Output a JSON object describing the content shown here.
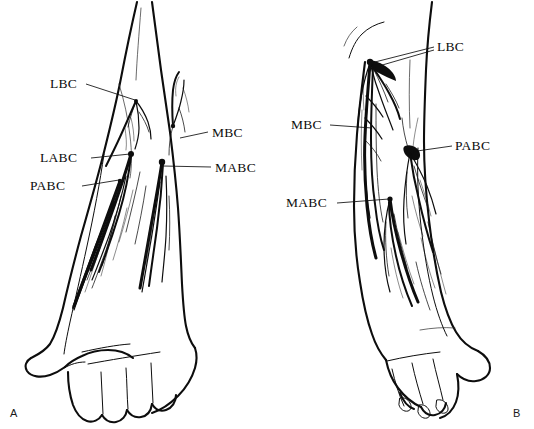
{
  "figure": {
    "background_color": "#ffffff",
    "ink_color": "#0d0d0d",
    "width": 534,
    "height": 429
  },
  "panels": [
    {
      "id": "A",
      "letter": "A",
      "letter_x": 10,
      "letter_y": 417,
      "view": "anterior",
      "labels": [
        {
          "id": "a-lbc",
          "text": "LBC",
          "name": "lateral-brachial-cutaneous",
          "text_x": 50,
          "text_y": 88,
          "leader": "M86,84 L135,100"
        },
        {
          "id": "a-labc",
          "text": "LABC",
          "name": "lateral-antebrachial-cutaneous",
          "text_x": 40,
          "text_y": 162,
          "leader": "M91,158 L130,154"
        },
        {
          "id": "a-pabc",
          "text": "PABC",
          "name": "posterior-antebrachial-cutaneous",
          "text_x": 30,
          "text_y": 190,
          "leader": "M82,186 L119,180"
        },
        {
          "id": "a-mbc",
          "text": "MBC",
          "name": "medial-brachial-cutaneous",
          "text_x": 212,
          "text_y": 137,
          "leader": "M208,132 L180,138"
        },
        {
          "id": "a-mabc",
          "text": "MABC",
          "name": "medial-antebrachial-cutaneous",
          "text_x": 215,
          "text_y": 172,
          "leader": "M211,167 L163,166"
        }
      ]
    },
    {
      "id": "B",
      "letter": "B",
      "letter_x": 513,
      "letter_y": 417,
      "view": "posterior",
      "labels": [
        {
          "id": "b-lbc",
          "text": "LBC",
          "name": "lateral-brachial-cutaneous",
          "text_x": 437,
          "text_y": 51,
          "leader": "M434,47 L371,63"
        },
        {
          "id": "b-mbc",
          "text": "MBC",
          "name": "medial-brachial-cutaneous",
          "text_x": 291,
          "text_y": 129,
          "leader": "M330,125 L372,128"
        },
        {
          "id": "b-pabc",
          "text": "PABC",
          "name": "posterior-antebrachial-cutaneous",
          "text_x": 455,
          "text_y": 150,
          "leader": "M452,146 L410,152"
        },
        {
          "id": "b-mabc",
          "text": "MABC",
          "name": "medial-antebrachial-cutaneous",
          "text_x": 286,
          "text_y": 207,
          "leader": "M337,203 L389,199"
        }
      ]
    }
  ],
  "nerve_key": [
    {
      "abbr": "LBC",
      "meaning": "Lateral brachial cutaneous nerve"
    },
    {
      "abbr": "MBC",
      "meaning": "Medial brachial cutaneous nerve"
    },
    {
      "abbr": "LABC",
      "meaning": "Lateral antebrachial cutaneous nerve"
    },
    {
      "abbr": "MABC",
      "meaning": "Medial antebrachial cutaneous nerve"
    },
    {
      "abbr": "PABC",
      "meaning": "Posterior antebrachial cutaneous nerve"
    }
  ]
}
